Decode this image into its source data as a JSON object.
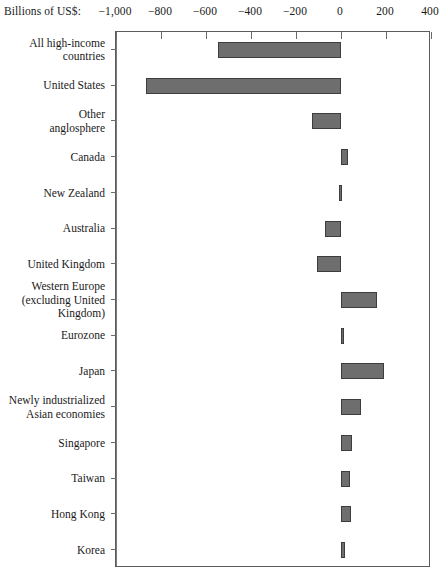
{
  "axis": {
    "caption": "Billions of US$:",
    "ticks": [
      -1000,
      -800,
      -600,
      -400,
      -200,
      0,
      200,
      400
    ],
    "tick_labels": [
      "−1,000",
      "−1200",
      "−600",
      "−400",
      "−200",
      "0",
      "200",
      "400"
    ]
  },
  "style": {
    "bar_fill": "#6e6e6e",
    "bar_stroke": "#3d3d3d",
    "frame_stroke": "#5c5c5c",
    "zero_line": "#7a7a7a"
  },
  "chart_data": {
    "type": "bar",
    "orientation": "horizontal",
    "title": "",
    "subtitle": "",
    "xlabel": "Billions of US$:",
    "ylabel": "",
    "xlim": [
      -1000,
      400
    ],
    "ylim": null,
    "grid": false,
    "legend": null,
    "xticks": [
      -1000,
      -800,
      -600,
      -400,
      -200,
      0,
      200,
      400
    ],
    "xticklabels": [
      "−1,000",
      "−800",
      "−600",
      "−400",
      "−200",
      "0",
      "200",
      "400"
    ],
    "zero_reference_line": 0,
    "units": "Billions of US$",
    "categories": [
      "All high-income\ncountries",
      "United States",
      "Other\nanglosphere",
      "Canada",
      "New Zealand",
      "Australia",
      "United Kingdom",
      "Western Europe\n(excluding United\nKingdom)",
      "Eurozone",
      "Japan",
      "Newly industrialized\nAsian economies",
      "Singapore",
      "Taiwan",
      "Hong Kong",
      "Korea"
    ],
    "values": [
      -548,
      -866,
      -128,
      30,
      -8,
      -70,
      -105,
      160,
      10,
      190,
      88,
      48,
      42,
      45,
      18
    ]
  }
}
